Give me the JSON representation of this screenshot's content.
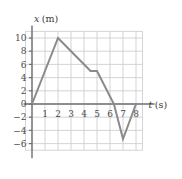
{
  "chart_data": {
    "type": "line",
    "title": "",
    "subtitle": "",
    "xlabel": "t (s)",
    "ylabel": "x (m)",
    "xlabel_symbol": "t",
    "xlabel_unit": "(s)",
    "ylabel_symbol": "x",
    "ylabel_unit": "(m)",
    "xlim": [
      -0.5,
      8.5
    ],
    "ylim": [
      -7,
      11
    ],
    "grid": true,
    "legend": null,
    "legend_position": "none",
    "xticks": [
      1,
      2,
      3,
      4,
      5,
      6,
      7,
      8
    ],
    "xtick_labels": [
      "1",
      "2",
      "3",
      "4",
      "5",
      "6",
      "7",
      "8"
    ],
    "yticks": [
      -6,
      -4,
      -2,
      0,
      2,
      4,
      6,
      8,
      10
    ],
    "ytick_labels": [
      "-6",
      "-4",
      "-2",
      "0",
      "2",
      "4",
      "6",
      "8",
      "10"
    ],
    "series": [
      {
        "name": "position",
        "color": "#8a8a8a",
        "x": [
          0,
          2,
          4.5,
          5,
          6.3,
          7,
          8
        ],
        "y": [
          0,
          10,
          5,
          5,
          0,
          -5.3,
          0
        ]
      }
    ],
    "grid_color": "#c9c9cf",
    "axis_color": "#6f6f75",
    "line_color": "#8a8a8a",
    "line_width": 2.0
  }
}
